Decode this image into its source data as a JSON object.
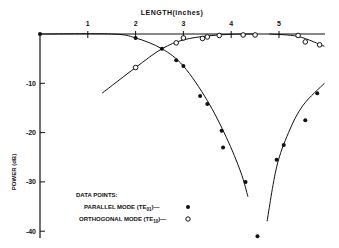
{
  "chart_data": {
    "type": "scatter",
    "title": "",
    "xlabel": "LENGTH(inches)",
    "ylabel": "POWER (dB)",
    "xlim": [
      0,
      6
    ],
    "ylim": [
      -42,
      0
    ],
    "x_ticks": [
      "1",
      "2",
      "3",
      "4",
      "5"
    ],
    "y_ticks": [
      "-10",
      "-20",
      "-30",
      "-40"
    ],
    "grid": false,
    "x_axis_position": "top",
    "legend": {
      "title": "DATA POINTS:",
      "entries": [
        {
          "label": "PARALLEL MODE (TE01)",
          "marker": "filled-circle"
        },
        {
          "label": "ORTHOGONAL MODE (TE10)",
          "marker": "open-circle"
        }
      ],
      "position": "lower-left"
    },
    "series": [
      {
        "name": "PARALLEL MODE (TE01)",
        "marker": "filled-circle",
        "x": [
          0.0,
          2.0,
          2.55,
          2.85,
          3.0,
          3.35,
          3.5,
          3.8,
          3.83,
          4.3,
          4.55,
          4.95,
          5.1,
          5.55,
          5.8
        ],
        "y": [
          0.0,
          -0.8,
          -3.0,
          -5.3,
          -6.5,
          -12.6,
          -14.2,
          -19.6,
          -23.0,
          -30.0,
          -41.0,
          -25.5,
          -22.5,
          -17.5,
          -12.0
        ]
      },
      {
        "name": "ORTHOGONAL MODE (TE10)",
        "marker": "open-circle",
        "x": [
          2.0,
          2.85,
          3.0,
          3.4,
          3.5,
          3.75,
          4.25,
          4.5,
          5.4,
          5.55,
          5.85
        ],
        "y": [
          -6.8,
          -1.8,
          -0.8,
          -0.9,
          -0.6,
          -0.3,
          -0.2,
          -0.2,
          -0.3,
          -1.6,
          -2.2
        ]
      }
    ],
    "fit_curves": [
      {
        "name": "TE01 decay",
        "points": [
          [
            0,
            0
          ],
          [
            1.5,
            0
          ],
          [
            2.0,
            -0.8
          ],
          [
            2.55,
            -3.0
          ],
          [
            3.0,
            -6.5
          ],
          [
            3.5,
            -13.5
          ],
          [
            3.9,
            -21
          ],
          [
            4.2,
            -28
          ],
          [
            4.35,
            -33
          ]
        ]
      },
      {
        "name": "TE01 recovery",
        "points": [
          [
            4.75,
            -38
          ],
          [
            4.95,
            -27
          ],
          [
            5.2,
            -20
          ],
          [
            5.5,
            -14.5
          ],
          [
            5.95,
            -10
          ]
        ]
      },
      {
        "name": "TE10 rise",
        "points": [
          [
            1.3,
            -12
          ],
          [
            2.0,
            -6.8
          ],
          [
            2.55,
            -3.0
          ],
          [
            3.0,
            -1.2
          ],
          [
            3.5,
            -0.4
          ],
          [
            4.0,
            -0.05
          ],
          [
            4.5,
            0
          ]
        ]
      },
      {
        "name": "TE10 decay",
        "points": [
          [
            4.8,
            0
          ],
          [
            5.4,
            -0.5
          ],
          [
            5.95,
            -2.5
          ]
        ]
      }
    ]
  }
}
